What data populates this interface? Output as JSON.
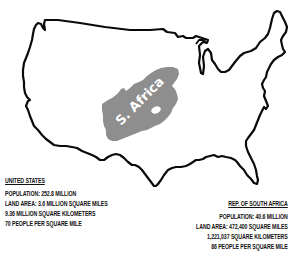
{
  "map": {
    "overlay_label": "S. Africa",
    "colors": {
      "outline": "#0a0a0a",
      "us_fill": "#ffffff",
      "south_africa_fill": "#8e8e8e",
      "label_text": "#ffffff",
      "background": "#ffffff"
    }
  },
  "united_states": {
    "heading": "UNITED STATES",
    "population": "POPULATION: 252.8 MILLION",
    "land_area_miles": "LAND AREA: 3.6 MILLION SQUARE MILES",
    "land_area_km": "9.36 MILLION SQUARE KILOMETERS",
    "density": "70 PEOPLE PER SQUARE MILE"
  },
  "south_africa": {
    "heading": "REP. OF SOUTH AFRICA",
    "population": "POPULATION: 40.6 MILLION",
    "land_area_miles": "LAND AREA: 472,400 SQUARE MILES",
    "land_area_km": "1,221,037 SQUARE KILOMETERS",
    "density": "86 PEOPLE PER SQUARE MILE"
  }
}
